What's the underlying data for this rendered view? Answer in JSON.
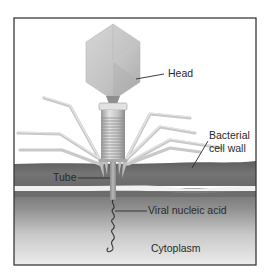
{
  "diagram": {
    "type": "labeled-illustration",
    "labels": {
      "head": "Head",
      "bacterial_cell_wall_line1": "Bacterial",
      "bacterial_cell_wall_line2": "cell wall",
      "tube": "Tube",
      "viral_nucleic_acid": "Viral nucleic acid",
      "cytoplasm": "Cytoplasm"
    },
    "colors": {
      "border": "#3a3a3a",
      "background": "#ffffff",
      "capsid": "#c8c8c8",
      "capsid_shade": "#a9a9a9",
      "tail_sheath": "#cfcfcf",
      "tail_fibers": "#d2d2d2",
      "cell_wall": "#6e6e6e",
      "membrane_stripe": "#efefef",
      "cytoplasm_top": "#7a7a7a",
      "cytoplasm_bottom": "#ececec",
      "nucleic_acid": "#3a3a3a",
      "leader_line": "#2a2a2a"
    }
  }
}
